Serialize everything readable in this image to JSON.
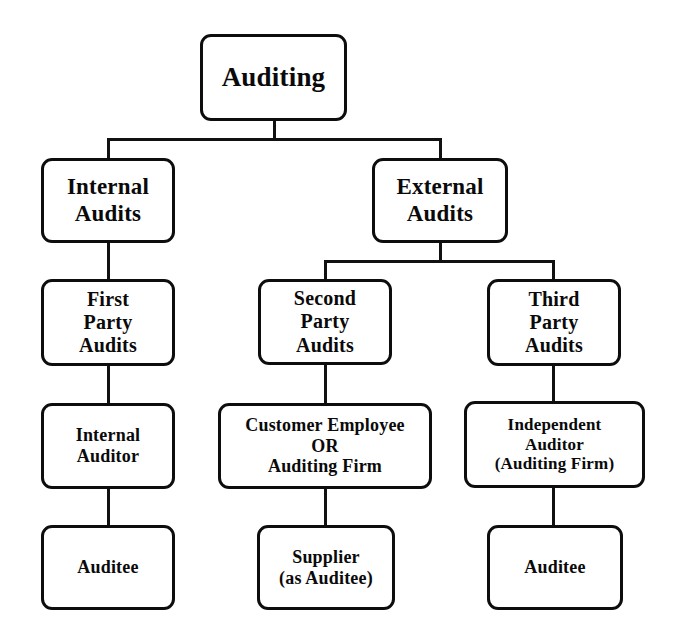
{
  "diagram": {
    "background_color": "#ffffff",
    "line_color": "#111111",
    "box_border_color": "#0d0d0d",
    "text_color": "#0a0a0a",
    "nodes": {
      "auditing": "Auditing",
      "internal_audits": "Internal\nAudits",
      "external_audits": "External\nAudits",
      "first_party_audits": "First\nParty\nAudits",
      "second_party_audits": "Second\nParty\nAudits",
      "third_party_audits": "Third\nParty\nAudits",
      "internal_auditor": "Internal\nAuditor",
      "customer_employee_or_auditing_firm": "Customer Employee\nOR\nAuditing Firm",
      "independent_auditor": "Independent\nAuditor\n(Auditing Firm)",
      "auditee_left": "Auditee",
      "supplier_as_auditee": "Supplier\n(as Auditee)",
      "auditee_right": "Auditee"
    }
  }
}
